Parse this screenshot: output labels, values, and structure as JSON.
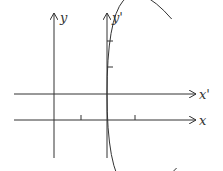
{
  "diagram": {
    "labels": {
      "y_axis": "y",
      "y_prime_axis": "y'",
      "x_prime_axis": "x'",
      "x_axis": "x"
    },
    "colors": {
      "stroke": "#333333",
      "background": "#ffffff"
    }
  }
}
